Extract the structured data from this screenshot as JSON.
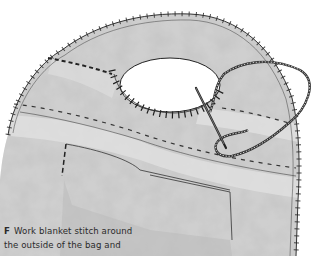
{
  "figure": {
    "colors": {
      "background": "#ffffff",
      "felt": "#b8b8b8",
      "felt_dark": "#8e8e8e",
      "stitch": "#2b2b2b",
      "text": "#2a2a2a"
    }
  },
  "caption": {
    "step_letter": "F",
    "line1": "Work blanket stitch around",
    "line2": "the outside of the bag and"
  }
}
